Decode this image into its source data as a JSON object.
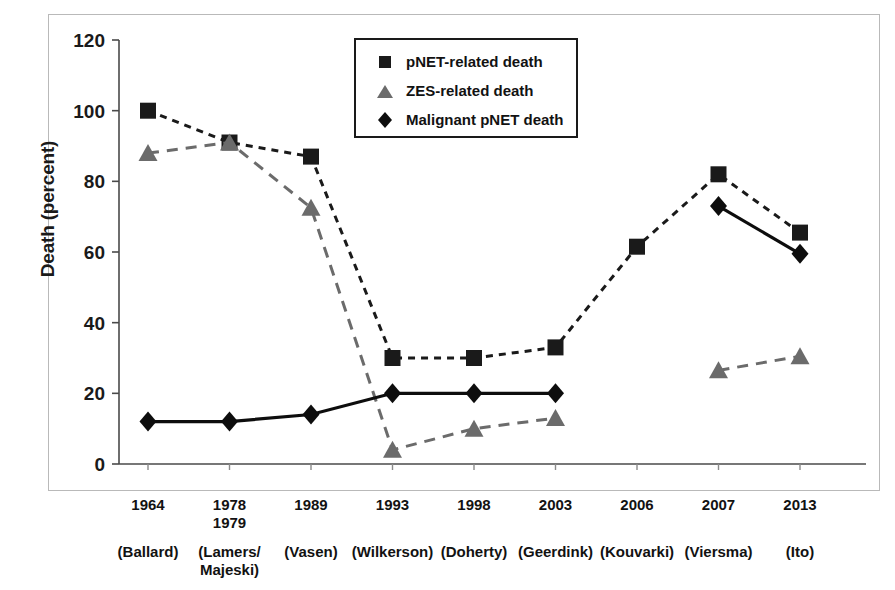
{
  "chart_data": {
    "type": "line",
    "title": "",
    "xlabel": "",
    "ylabel": "Death (percent)",
    "ylim": [
      0,
      120
    ],
    "yticks": [
      0,
      20,
      40,
      60,
      80,
      100,
      120
    ],
    "grid": false,
    "legend_position": "top-center",
    "categories": [
      "1964",
      "1978\n1979",
      "1989",
      "1993",
      "1998",
      "2003",
      "2006",
      "2007",
      "2013"
    ],
    "category_years": [
      "1964",
      "1978 1979",
      "1989",
      "1993",
      "1998",
      "2003",
      "2006",
      "2007",
      "2013"
    ],
    "category_authors": [
      "(Ballard)",
      "(Lamers/\nMajeski)",
      "(Vasen)",
      "(Wilkerson)",
      "(Doherty)",
      "(Geerdink)",
      "(Kouvarki)",
      "(Viersma)",
      "(Ito)"
    ],
    "series": [
      {
        "name": "pNET-related death",
        "marker": "square",
        "linestyle": "dashed",
        "color": "#1a1a1a",
        "values": [
          100,
          91,
          87,
          30,
          30,
          33,
          61.5,
          82,
          65.5
        ]
      },
      {
        "name": "ZES-related death",
        "marker": "triangle",
        "linestyle": "dashed",
        "color": "#6b6b6b",
        "values": [
          88,
          91,
          72.5,
          4,
          10,
          13,
          null,
          26.5,
          30.5
        ]
      },
      {
        "name": "Malignant pNET death",
        "marker": "diamond",
        "linestyle": "solid",
        "color": "#0d0d0d",
        "values": [
          12,
          12,
          14,
          20,
          20,
          20,
          null,
          73,
          59.5
        ]
      }
    ]
  },
  "axes": {
    "y_title": "Death (percent)"
  },
  "legend": {
    "entries": [
      {
        "label": "pNET-related death",
        "marker": "square"
      },
      {
        "label": "ZES-related death",
        "marker": "triangle"
      },
      {
        "label": "Malignant pNET death",
        "marker": "diamond"
      }
    ]
  }
}
